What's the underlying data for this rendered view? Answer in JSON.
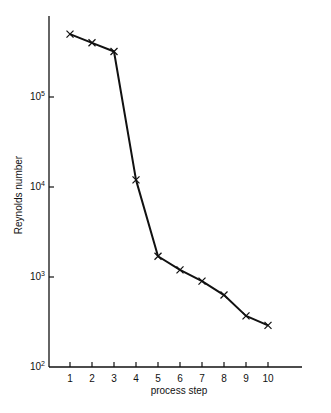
{
  "chart_data": {
    "type": "line",
    "title": "",
    "xlabel": "process step",
    "ylabel": "Reynolds number",
    "yscale": "log",
    "ylim": [
      100,
      1000000
    ],
    "grid": false,
    "legend": null,
    "marker": "x",
    "x": [
      1,
      2,
      3,
      4,
      5,
      6,
      7,
      8,
      9,
      10
    ],
    "categories": [
      "1",
      "2",
      "3",
      "4",
      "5",
      "6",
      "7",
      "8",
      "9",
      "10"
    ],
    "series": [
      {
        "name": "Reynolds number",
        "values": [
          500000,
          400000,
          320000,
          12000,
          1700,
          1200,
          900,
          630,
          370,
          290
        ]
      }
    ],
    "yticks": [
      {
        "base": "10",
        "exp": "2",
        "value": 100
      },
      {
        "base": "10",
        "exp": "3",
        "value": 1000
      },
      {
        "base": "10",
        "exp": "4",
        "value": 10000
      },
      {
        "base": "10",
        "exp": "5",
        "value": 100000
      }
    ],
    "colors": {
      "line": "#111111",
      "axis": "#111111",
      "background": "#ffffff"
    }
  }
}
